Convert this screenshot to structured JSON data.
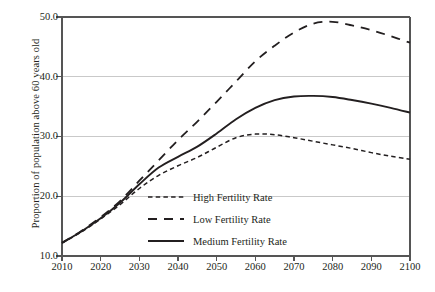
{
  "chart_data": {
    "type": "line",
    "title": "",
    "xlabel": "",
    "ylabel": "Proportion of population above 60 years old",
    "xlim": [
      2010,
      2100
    ],
    "ylim": [
      10.0,
      50.0
    ],
    "grid": true,
    "legend_position": "inside-lower-left",
    "xticks": [
      "2010",
      "2020",
      "2030",
      "2040",
      "2050",
      "2060",
      "2070",
      "2080",
      "2090",
      "2100"
    ],
    "xtick_values": [
      2010,
      2020,
      2030,
      2040,
      2050,
      2060,
      2070,
      2080,
      2090,
      2100
    ],
    "yticks": [
      "10.0",
      "20.0",
      "30.0",
      "40.0",
      "50.0"
    ],
    "ytick_values": [
      10.0,
      20.0,
      30.0,
      40.0,
      50.0
    ],
    "x": [
      2010,
      2015,
      2020,
      2025,
      2030,
      2035,
      2040,
      2045,
      2050,
      2055,
      2060,
      2065,
      2070,
      2075,
      2080,
      2085,
      2090,
      2095,
      2100
    ],
    "series": [
      {
        "name": "High Fertility Rate",
        "style": "fine-dashed",
        "color": "#231f20",
        "values": [
          12.2,
          14.0,
          16.2,
          18.6,
          21.3,
          23.5,
          25.1,
          26.5,
          28.2,
          29.8,
          30.4,
          30.3,
          29.8,
          29.2,
          28.6,
          28.0,
          27.3,
          26.7,
          26.2
        ]
      },
      {
        "name": "Low Fertility Rate",
        "style": "long-dashed",
        "color": "#231f20",
        "values": [
          12.2,
          14.2,
          16.5,
          19.2,
          22.6,
          26.0,
          29.4,
          32.5,
          35.8,
          39.2,
          42.6,
          45.2,
          47.4,
          48.9,
          49.2,
          48.6,
          47.8,
          46.8,
          45.7
        ]
      },
      {
        "name": "Medium Fertility Rate",
        "style": "solid",
        "color": "#231f20",
        "values": [
          12.2,
          14.1,
          16.3,
          18.9,
          22.0,
          24.8,
          26.6,
          28.3,
          30.5,
          32.9,
          34.8,
          36.1,
          36.7,
          36.8,
          36.6,
          36.1,
          35.5,
          34.8,
          34.0
        ]
      }
    ]
  },
  "legend": {
    "items": [
      {
        "label": "High Fertility Rate",
        "style": "fine-dashed"
      },
      {
        "label": "Low Fertility Rate",
        "style": "long-dashed"
      },
      {
        "label": "Medium Fertility Rate",
        "style": "solid"
      }
    ]
  },
  "axes": {
    "y_title": "Proportion of population above 60 years old"
  },
  "colors": {
    "ink": "#231f20",
    "grid": "#c9c9c9",
    "axis": "#444444",
    "background": "#ffffff"
  }
}
